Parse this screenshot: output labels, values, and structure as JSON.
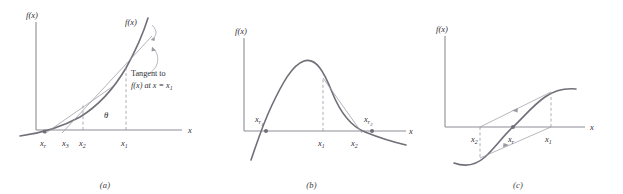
{
  "figure": {
    "type": "diagram",
    "panels": [
      {
        "id": "a",
        "caption": "(a)",
        "axis_y_label": "f(x)",
        "axis_x_label": "x",
        "curve_label": "f(x)",
        "annotation_line1": "Tangent to",
        "annotation_line2_prefix": "f(x) at x = x",
        "annotation_line2_sub": "1",
        "angle_label": "θ",
        "tick_labels": [
          {
            "base": "x",
            "sub": "r"
          },
          {
            "base": "x",
            "sub": "3"
          },
          {
            "base": "x",
            "sub": "2"
          },
          {
            "base": "x",
            "sub": "1"
          }
        ],
        "curve_kind": "exponential-increasing",
        "root_marker": true
      },
      {
        "id": "b",
        "caption": "(b)",
        "axis_y_label": "f(x)",
        "axis_x_label": "x",
        "tick_labels": [
          {
            "base": "x",
            "sub": "1"
          },
          {
            "base": "x",
            "sub": "2"
          }
        ],
        "root_labels": [
          {
            "base": "x",
            "sub": "r",
            "sub2": "1"
          },
          {
            "base": "x",
            "sub": "r",
            "sub2": "2"
          }
        ],
        "curve_kind": "single-hump-peak",
        "root_marker": true
      },
      {
        "id": "c",
        "caption": "(c)",
        "axis_y_label": "f(x)",
        "axis_x_label": "x",
        "tick_labels": [
          {
            "base": "x",
            "sub": "2"
          },
          {
            "base": "x",
            "sub": "r"
          },
          {
            "base": "x",
            "sub": "1"
          }
        ],
        "curve_kind": "sigmoid-oscillating",
        "root_marker": true,
        "has_arrows": true
      }
    ],
    "colors": {
      "curve": "#6f6f78",
      "axis": "#8d8d95",
      "construction": "#9a9aa2",
      "dashed": "#9a9aa2",
      "text": "#303034",
      "marker": "#70707a",
      "background": "#ffffff"
    }
  }
}
